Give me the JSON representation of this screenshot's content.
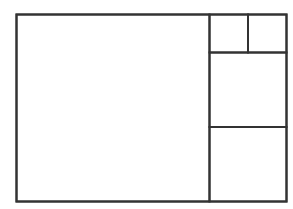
{
  "diagram": {
    "title": "",
    "stroke_color": "#333333",
    "background_color": "#ffffff",
    "panels": [
      {
        "id": "large-left-panel",
        "label": ""
      },
      {
        "id": "top-right-small-left-panel",
        "label": ""
      },
      {
        "id": "top-right-small-right-panel",
        "label": ""
      },
      {
        "id": "middle-right-panel",
        "label": ""
      },
      {
        "id": "bottom-right-panel",
        "label": ""
      }
    ]
  }
}
